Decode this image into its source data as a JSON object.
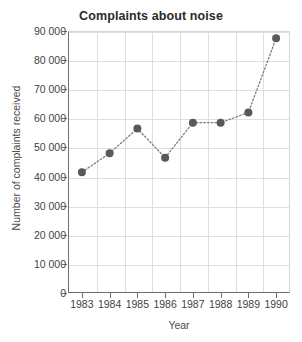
{
  "chart_data": {
    "type": "line",
    "title": "Complaints about noise",
    "xlabel": "Year",
    "ylabel": "Number of complaints received",
    "categories": [
      "1983",
      "1984",
      "1985",
      "1986",
      "1987",
      "1988",
      "1989",
      "1990"
    ],
    "values": [
      41500,
      48000,
      56500,
      46500,
      58500,
      58500,
      62000,
      87500
    ],
    "series": [
      {
        "name": "Complaints about noise",
        "values": [
          41500,
          48000,
          56500,
          46500,
          58500,
          58500,
          62000,
          87500
        ]
      }
    ],
    "ylim": [
      0,
      90000
    ],
    "y_ticks": [
      0,
      10000,
      20000,
      30000,
      40000,
      50000,
      60000,
      70000,
      80000,
      90000
    ],
    "y_tick_labels": [
      "0",
      "10 000",
      "20 000",
      "30 000",
      "40 000",
      "50 000",
      "60 000",
      "70 000",
      "80 000",
      "90 000"
    ],
    "grid": true,
    "legend": false,
    "marker": "circle",
    "line_style": "dotted",
    "colors": {
      "marker": "#595959",
      "line": "#7d7d7d",
      "grid": "#dedede",
      "axis": "#6e6e6e",
      "title_text": "#2b2b2b",
      "label_text": "#3f3f3f",
      "background": "#ffffff"
    }
  }
}
